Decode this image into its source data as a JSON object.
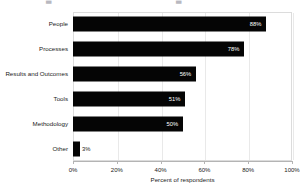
{
  "title_remnant": {
    "fragment_left": "▃",
    "fragment_right": "▃"
  },
  "chart_data": {
    "type": "bar",
    "orientation": "horizontal",
    "title": "",
    "xlabel": "Percent of respondents",
    "ylabel": "",
    "categories": [
      "People",
      "Processes",
      "Results and Outcomes",
      "Tools",
      "Methodology",
      "Other"
    ],
    "values": [
      88,
      78,
      56,
      51,
      50,
      3
    ],
    "value_labels": [
      "88%",
      "78%",
      "56%",
      "51%",
      "50%",
      "3%"
    ],
    "label_inside": [
      true,
      true,
      true,
      true,
      true,
      false
    ],
    "xlim": [
      0,
      100
    ],
    "xticks": [
      0,
      20,
      40,
      60,
      80,
      100
    ],
    "xtick_labels": [
      "0%",
      "20%",
      "40%",
      "60%",
      "80%",
      "100%"
    ],
    "grid": "vertical",
    "legend": "none",
    "bar_color": "#050505",
    "plot_border_color": "#dcdcdc",
    "gridline_color": "#e9e9e9",
    "background_color": "#ffffff"
  }
}
